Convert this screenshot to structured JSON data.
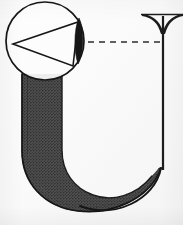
{
  "figure": {
    "subject_letter": "U",
    "background_color": "#fbfbfb",
    "ink_color": "#1a1a1a",
    "stroke_fill_color": "#4a4a4a",
    "lens_fill_color": "#161616",
    "serif_fill_color": "#1c1c1c",
    "dash_color": "#2b2b2b",
    "media": "halftone scan",
    "caption_text": "",
    "elements": {
      "circle": {
        "name": "construction circle",
        "center_x": 45,
        "center_y": 41,
        "radius": 39,
        "stroke_width": 1.6,
        "fill": "none"
      },
      "triangle": {
        "name": "inscribed triangle",
        "apex_x": 13,
        "apex_y": 44,
        "upper_x": 78,
        "upper_y": 22,
        "lower_x": 73,
        "lower_y": 66,
        "stroke_width": 1.5,
        "fill": "none"
      },
      "lens": {
        "name": "dark lens wedge",
        "top_x": 79,
        "top_y": 18,
        "bottom_x": 78,
        "bottom_y": 64,
        "width": 9
      },
      "dashed_line": {
        "name": "horizontal alignment guide",
        "x1": 88,
        "y1": 42,
        "x2": 160,
        "y2": 42,
        "dash_pattern": "6 5",
        "stroke_width": 1.6
      },
      "left_stem": {
        "name": "thick halftone stem",
        "x_left": 28,
        "x_right": 62,
        "y_top": 74,
        "y_bottom": 150
      },
      "right_stem": {
        "name": "thin right stroke",
        "x": 163,
        "y_top": 16,
        "y_bottom": 165,
        "stroke_width": 2.2
      },
      "top_serif": {
        "name": "flared serif terminal",
        "center_x": 163,
        "y": 16,
        "half_width": 21,
        "depth": 15
      },
      "bowl": {
        "name": "curved bottom bowl",
        "y_baseline": 205
      }
    }
  }
}
